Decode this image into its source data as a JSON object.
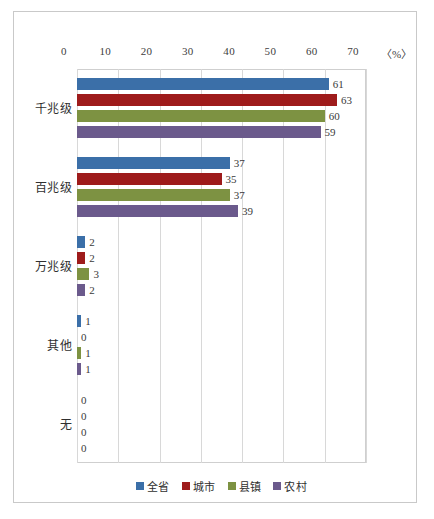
{
  "chart_data": {
    "type": "bar",
    "orientation": "horizontal",
    "title": "",
    "xlabel": "〈%〉",
    "ylabel": "",
    "xlim": [
      0,
      70
    ],
    "xticks": [
      0,
      10,
      20,
      30,
      40,
      50,
      60,
      70
    ],
    "xtick_labels": [
      "0",
      "10",
      "20",
      "30",
      "40",
      "50",
      "60",
      "70"
    ],
    "grid": true,
    "legend_position": "bottom",
    "categories": [
      "千兆级",
      "百兆级",
      "万兆级",
      "其他",
      "无"
    ],
    "series": [
      {
        "name": "全省",
        "color": "#3b6fa8",
        "values": [
          61,
          37,
          2,
          1,
          0
        ]
      },
      {
        "name": "城市",
        "color": "#9e1b1b",
        "values": [
          63,
          35,
          2,
          0,
          0
        ]
      },
      {
        "name": "县镇",
        "color": "#7d9242",
        "values": [
          60,
          37,
          3,
          1,
          0
        ]
      },
      {
        "name": "农村",
        "color": "#6b5a8c",
        "values": [
          59,
          39,
          2,
          1,
          0
        ]
      }
    ]
  },
  "axis": {
    "unit_label": "〈%〉"
  },
  "legend": {
    "items": [
      {
        "label": "全省",
        "color": "#3b6fa8"
      },
      {
        "label": "城市",
        "color": "#9e1b1b"
      },
      {
        "label": "县镇",
        "color": "#7d9242"
      },
      {
        "label": "农村",
        "color": "#6b5a8c"
      }
    ]
  }
}
